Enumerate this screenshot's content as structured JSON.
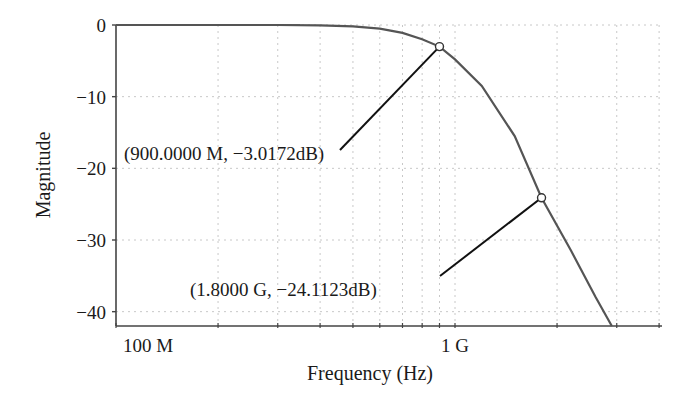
{
  "chart_data": {
    "type": "line",
    "title": "",
    "xlabel": "Frequency (Hz)",
    "ylabel": "Magnitude",
    "x_scale": "log",
    "xlim": [
      100000000,
      4900000000
    ],
    "ylim": [
      -42,
      0
    ],
    "grid": true,
    "x_ticks": [
      {
        "value": 100000000,
        "label": "100 M"
      },
      {
        "value": 1000000000,
        "label": "1 G"
      }
    ],
    "y_ticks": [
      {
        "value": 0,
        "label": "0"
      },
      {
        "value": -10,
        "label": "−10"
      },
      {
        "value": -20,
        "label": "−20"
      },
      {
        "value": -30,
        "label": "−30"
      },
      {
        "value": -40,
        "label": "−40"
      }
    ],
    "series": [
      {
        "name": "Magnitude response",
        "color": "#555555",
        "x": [
          100000000,
          200000000,
          300000000,
          400000000,
          500000000,
          600000000,
          700000000,
          800000000,
          900000000,
          1000000000,
          1200000000,
          1500000000,
          1800000000,
          2200000000,
          2600000000,
          2900000000
        ],
        "y": [
          0,
          0,
          0,
          -0.05,
          -0.2,
          -0.5,
          -1.1,
          -2.0,
          -3.0172,
          -4.8,
          -8.5,
          -15.5,
          -24.1123,
          -31.5,
          -38,
          -42
        ]
      }
    ],
    "annotations": [
      {
        "x": 900000000,
        "y": -3.0172,
        "label": "(900.0000 M, −3.0172dB)"
      },
      {
        "x": 1800000000,
        "y": -24.1123,
        "label": "(1.8000 G, −24.1123dB)"
      }
    ]
  }
}
